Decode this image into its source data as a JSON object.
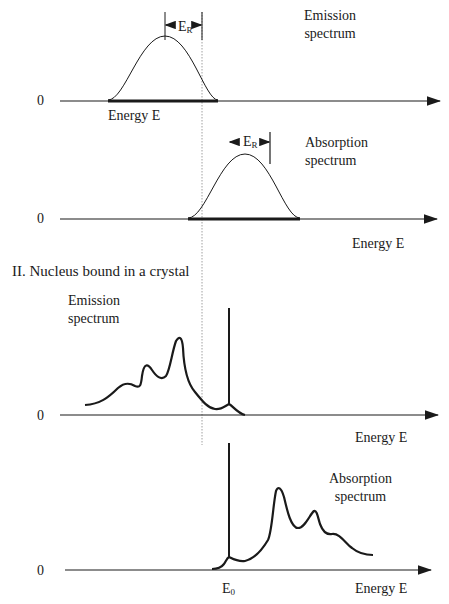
{
  "section_free": {
    "emission": {
      "label_line1": "Emission",
      "label_line2": "spectrum",
      "zero_label": "0",
      "axis_label": "Energy E",
      "recoil_label": "E",
      "recoil_sub": "R"
    },
    "absorption": {
      "label_line1": "Absorption",
      "label_line2": "spectrum",
      "zero_label": "0",
      "axis_label": "Energy E",
      "recoil_label": "E",
      "recoil_sub": "R"
    }
  },
  "section_crystal": {
    "heading": "II. Nucleus bound in a crystal",
    "emission": {
      "label_line1": "Emission",
      "label_line2": "spectrum",
      "zero_label": "0",
      "axis_label": "Energy E"
    },
    "absorption": {
      "label_line1": "Absorption",
      "label_line2": "spectrum",
      "zero_label": "0",
      "axis_label": "Energy E",
      "line_label": "E",
      "line_sub": "0"
    }
  },
  "colors": {
    "ink": "#1a1a1a",
    "dotted_line": "#888888"
  }
}
